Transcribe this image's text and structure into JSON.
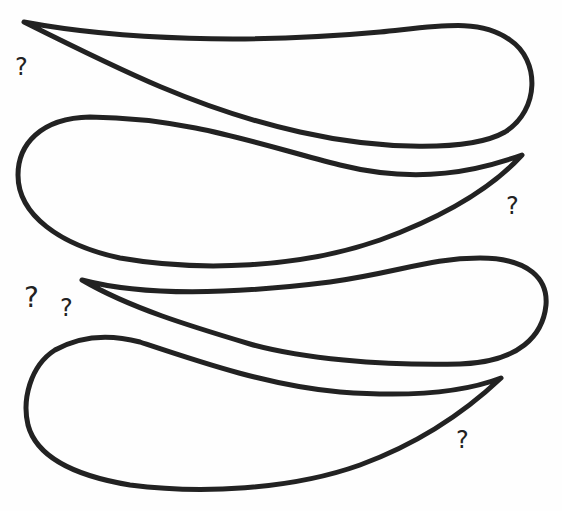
{
  "diagram": {
    "stroke_color": "#222222",
    "background": "#fefefe",
    "shapes": [
      {
        "id": "shape-1",
        "tip": "left",
        "round_end": "right"
      },
      {
        "id": "shape-2",
        "tip": "right",
        "round_end": "left"
      },
      {
        "id": "shape-3",
        "tip": "left",
        "round_end": "right"
      },
      {
        "id": "shape-4",
        "tip": "right",
        "round_end": "left"
      }
    ],
    "labels": [
      {
        "id": "q1",
        "text": "?"
      },
      {
        "id": "q2",
        "text": "?"
      },
      {
        "id": "q3",
        "text": "?"
      },
      {
        "id": "q4",
        "text": "?"
      },
      {
        "id": "q5",
        "text": "?"
      }
    ]
  }
}
